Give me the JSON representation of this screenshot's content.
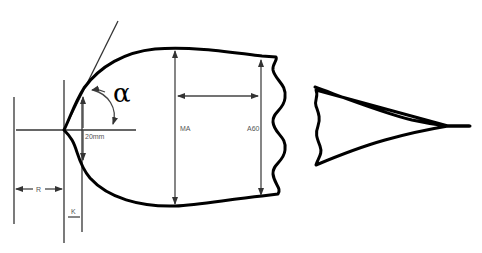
{
  "diagram": {
    "labels": {
      "alpha": "α",
      "twenty_mm": "20mm",
      "ma": "MA",
      "a60": "A60",
      "r": "R",
      "k": "K"
    },
    "colors": {
      "outline": "#000000",
      "dimension": "#444444",
      "label": "#555555",
      "background": "#ffffff"
    }
  }
}
